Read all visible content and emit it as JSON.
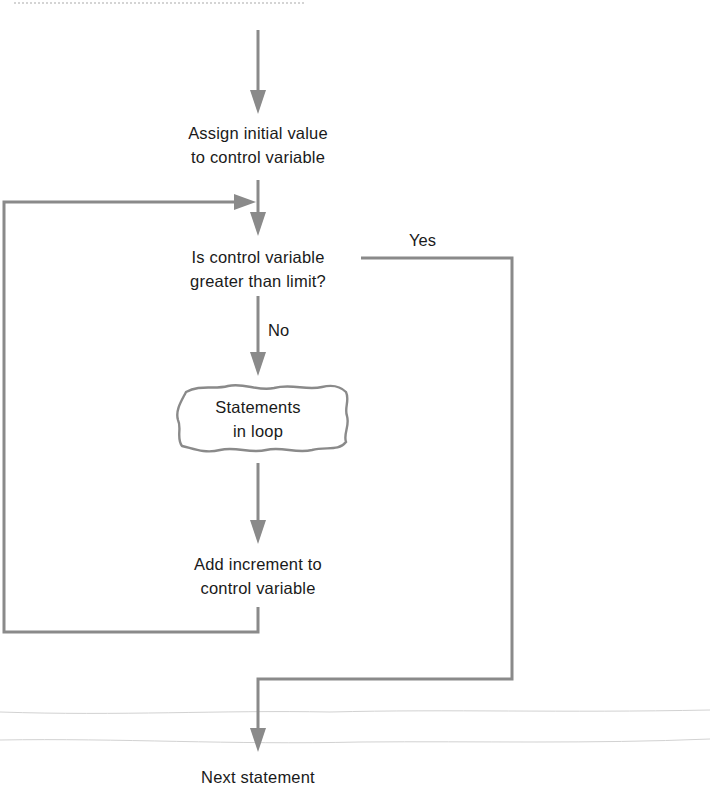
{
  "diagram": {
    "type": "flowchart",
    "title": "",
    "colors": {
      "arrow": "#8a8a8a",
      "text": "#1a1a1a",
      "background": "#ffffff",
      "paper_crease": "#c9c9c9"
    },
    "nodes": [
      {
        "id": "assign",
        "shape": "text",
        "lines": [
          "Assign initial value",
          "to control variable"
        ]
      },
      {
        "id": "test",
        "shape": "decision-text",
        "lines": [
          "Is control variable",
          "greater than limit?"
        ]
      },
      {
        "id": "body",
        "shape": "wavy-box",
        "lines": [
          "Statements",
          "in loop"
        ]
      },
      {
        "id": "increment",
        "shape": "text",
        "lines": [
          "Add increment to",
          "control variable"
        ]
      },
      {
        "id": "next",
        "shape": "text",
        "lines": [
          "Next statement"
        ]
      }
    ],
    "edges": [
      {
        "from": "start",
        "to": "assign",
        "label": ""
      },
      {
        "from": "assign",
        "to": "test",
        "label": ""
      },
      {
        "from": "test",
        "to": "body",
        "label": "No"
      },
      {
        "from": "test",
        "to": "next",
        "label": "Yes"
      },
      {
        "from": "body",
        "to": "increment",
        "label": ""
      },
      {
        "from": "increment",
        "to": "test",
        "label": "",
        "note": "loop back"
      }
    ],
    "edge_labels": {
      "yes": "Yes",
      "no": "No"
    }
  }
}
